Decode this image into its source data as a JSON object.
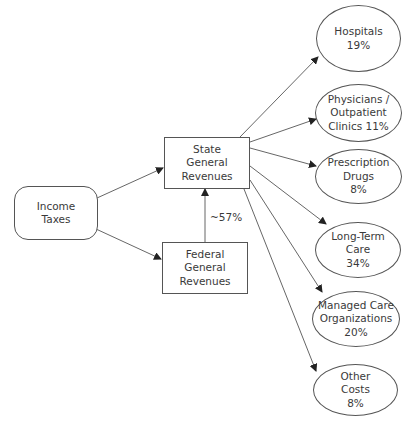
{
  "diagram": {
    "type": "flowchart",
    "nodes": {
      "income_taxes": {
        "lines": [
          "Income",
          "Taxes"
        ],
        "shape": "rounded-rect"
      },
      "state_general_revenues": {
        "lines": [
          "State",
          "General",
          "Revenues"
        ],
        "shape": "rect"
      },
      "federal_general_revenues": {
        "lines": [
          "Federal",
          "General",
          "Revenues"
        ],
        "shape": "rect"
      },
      "hospitals": {
        "lines": [
          "Hospitals",
          "19%"
        ],
        "shape": "ellipse"
      },
      "physicians": {
        "lines": [
          "Physicians /",
          "Outpatient",
          "Clinics 11%"
        ],
        "shape": "ellipse"
      },
      "prescription_drugs": {
        "lines": [
          "Prescription",
          "Drugs",
          "8%"
        ],
        "shape": "ellipse"
      },
      "long_term_care": {
        "lines": [
          "Long-Term",
          "Care",
          "34%"
        ],
        "shape": "ellipse"
      },
      "managed_care": {
        "lines": [
          "Managed Care",
          "Organizations",
          "20%"
        ],
        "shape": "ellipse"
      },
      "other_costs": {
        "lines": [
          "Other",
          "Costs",
          "8%"
        ],
        "shape": "ellipse"
      }
    },
    "edges": [
      {
        "from": "income_taxes",
        "to": "state_general_revenues",
        "label": ""
      },
      {
        "from": "income_taxes",
        "to": "federal_general_revenues",
        "label": ""
      },
      {
        "from": "federal_general_revenues",
        "to": "state_general_revenues",
        "label": "~57%"
      },
      {
        "from": "state_general_revenues",
        "to": "hospitals",
        "label": ""
      },
      {
        "from": "state_general_revenues",
        "to": "physicians",
        "label": ""
      },
      {
        "from": "state_general_revenues",
        "to": "prescription_drugs",
        "label": ""
      },
      {
        "from": "state_general_revenues",
        "to": "long_term_care",
        "label": ""
      },
      {
        "from": "state_general_revenues",
        "to": "managed_care",
        "label": ""
      },
      {
        "from": "state_general_revenues",
        "to": "other_costs",
        "label": ""
      }
    ],
    "colors": {
      "stroke": "#555555",
      "text": "#3a3a3a",
      "background": "#ffffff"
    }
  }
}
